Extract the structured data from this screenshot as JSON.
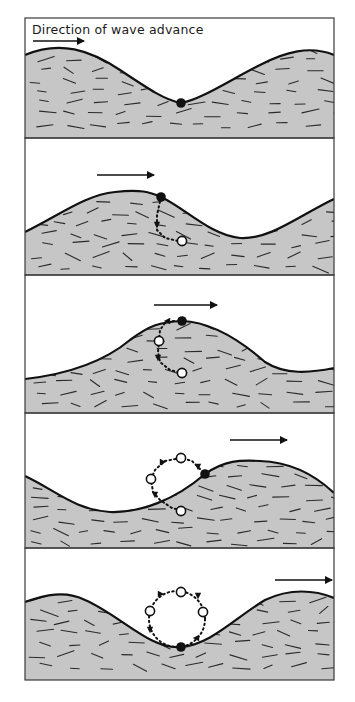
{
  "figure": {
    "title": "Direction of wave advance",
    "colors": {
      "background": "#ffffff",
      "water": "#c6c6c6",
      "outline": "#111111",
      "dash": "#2a2a2a",
      "frame": "#3a3a3a"
    },
    "frame": {
      "x": 25,
      "width": 309
    }
  },
  "panels": [
    {
      "id": 1,
      "top": 18,
      "bottom": 138,
      "surface": "M25,55 C60,40 90,50 120,70 C150,90 165,100 181,103 C200,100 230,80 260,65 C285,52 310,45 334,55",
      "arrow": {
        "x1": 33,
        "y1": 41,
        "x2": 84,
        "y2": 41
      },
      "filled_particle": {
        "x": 181,
        "y": 103
      },
      "open_particles": [],
      "path": ""
    },
    {
      "id": 2,
      "top": 138,
      "bottom": 275,
      "surface": "M25,232 C60,215 85,195 115,192 C140,189 150,192 161,197 C185,208 210,235 240,238 C270,240 300,215 334,199",
      "arrow": {
        "x1": 97,
        "y1": 175,
        "x2": 154,
        "y2": 175
      },
      "filled_particle": {
        "x": 161,
        "y": 197
      },
      "open_particles": [
        {
          "x": 182,
          "y": 241
        }
      ],
      "path": "M161,197 L157,215 L157,230 L165,238 L178,241",
      "path_arrows": [
        {
          "x": 157,
          "y": 225,
          "dir": "down"
        }
      ]
    },
    {
      "id": 3,
      "top": 275,
      "bottom": 413,
      "surface": "M25,379 C60,375 100,365 130,340 C150,325 160,322 182,321 C210,322 240,340 265,362 C285,375 310,373 334,368",
      "arrow": {
        "x1": 154,
        "y1": 305,
        "x2": 217,
        "y2": 305
      },
      "filled_particle": {
        "x": 182,
        "y": 321
      },
      "open_particles": [
        {
          "x": 159,
          "y": 341
        },
        {
          "x": 182,
          "y": 373
        }
      ],
      "path": "M174,321 L165,323 L160,330 L158,352 L160,362 L170,370 L178,372",
      "path_arrows": [
        {
          "x": 167,
          "y": 321,
          "dir": "left"
        },
        {
          "x": 158,
          "y": 358,
          "dir": "down"
        }
      ]
    },
    {
      "id": 4,
      "top": 413,
      "bottom": 548,
      "surface": "M25,476 C55,490 75,510 110,512 C140,513 175,500 205,474 C225,460 240,460 260,461 C290,462 315,475 334,493",
      "arrow": {
        "x1": 230,
        "y1": 440,
        "x2": 287,
        "y2": 440
      },
      "filled_particle": {
        "x": 205,
        "y": 474
      },
      "open_particles": [
        {
          "x": 181,
          "y": 458
        },
        {
          "x": 151,
          "y": 479
        },
        {
          "x": 181,
          "y": 511
        }
      ],
      "path": "M200,469 L192,461 L181,458 L165,461 L155,470 L151,479 L153,492 L160,500 L172,508 L180,510",
      "path_arrows": [
        {
          "x": 163,
          "y": 462,
          "dir": "right"
        },
        {
          "x": 155,
          "y": 495,
          "dir": "down"
        },
        {
          "x": 198,
          "y": 467,
          "dir": "down"
        }
      ]
    },
    {
      "id": 5,
      "top": 548,
      "bottom": 680,
      "surface": "M25,602 C45,595 65,590 85,600 C120,615 150,650 181,647 C210,645 235,618 265,600 C290,588 315,590 334,598",
      "arrow": {
        "x1": 275,
        "y1": 580,
        "x2": 332,
        "y2": 580
      },
      "filled_particle": {
        "x": 181,
        "y": 647
      },
      "open_particles": [
        {
          "x": 181,
          "y": 592
        },
        {
          "x": 150,
          "y": 611
        },
        {
          "x": 203,
          "y": 612
        }
      ],
      "circle": {
        "cx": 177,
        "cy": 619,
        "r": 28
      },
      "path_arrows": [
        {
          "x": 161,
          "y": 594,
          "dir": "right"
        },
        {
          "x": 198,
          "y": 596,
          "dir": "down"
        },
        {
          "x": 196,
          "y": 638,
          "dir": "left"
        },
        {
          "x": 150,
          "y": 630,
          "dir": "down"
        }
      ]
    }
  ]
}
